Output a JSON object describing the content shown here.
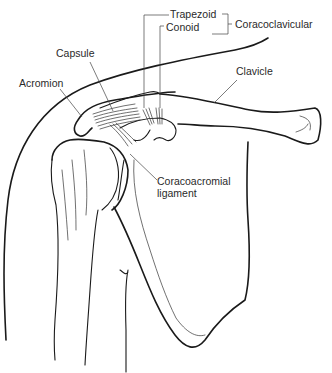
{
  "diagram": {
    "labels": {
      "trapezoid": "Trapezoid",
      "conoid": "Conoid",
      "coracoclavicular": "Coracoclavicular",
      "capsule": "Capsule",
      "acromion": "Acromion",
      "clavicle": "Clavicle",
      "coracoacromial_line1": "Coracoacromial",
      "coracoacromial_line2": "ligament"
    },
    "colors": {
      "line": "#1a1a1a",
      "text": "#2a2a2a",
      "background": "#ffffff"
    }
  }
}
